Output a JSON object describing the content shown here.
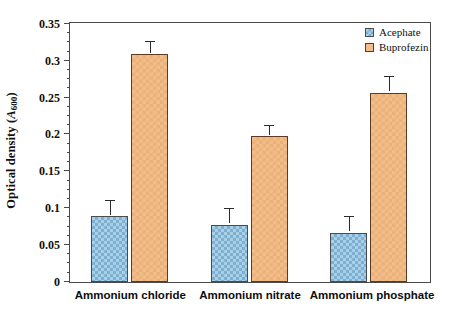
{
  "chart_data": {
    "type": "bar",
    "title": "",
    "xlabel": "",
    "ylabel": "Optical density (A600)",
    "ylabel_parts": {
      "main": "Optical density (",
      "italic": "A",
      "subscript": "600",
      "tail": ")"
    },
    "categories": [
      "Ammonium chloride",
      "Ammonium nitrate",
      "Ammonium phosphate"
    ],
    "series": [
      {
        "name": "Acephate",
        "values": [
          0.089,
          0.078,
          0.067
        ],
        "errors": [
          0.021,
          0.021,
          0.021
        ],
        "color": "#a9d0e6",
        "pattern": "checkerboard"
      },
      {
        "name": "Buprofezin",
        "values": [
          0.309,
          0.198,
          0.257
        ],
        "errors": [
          0.016,
          0.013,
          0.021
        ],
        "color": "#f2bd89",
        "pattern": "cross-hatch"
      }
    ],
    "ylim": [
      0,
      0.35
    ],
    "ytick_labels": [
      "0",
      "0.05",
      "0.1",
      "0.15",
      "0.2",
      "0.25",
      "0.3",
      "0.35"
    ],
    "ytick_values": [
      0,
      0.05,
      0.1,
      0.15,
      0.2,
      0.25,
      0.3,
      0.35
    ],
    "yminor_step": 0.0125,
    "grid": false,
    "legend_position": "top-right",
    "frame": true
  },
  "legend": {
    "items": [
      {
        "label": "Acephate"
      },
      {
        "label": "Buprofezin"
      }
    ]
  },
  "axis": {
    "y_title": "Optical density (A600)"
  }
}
